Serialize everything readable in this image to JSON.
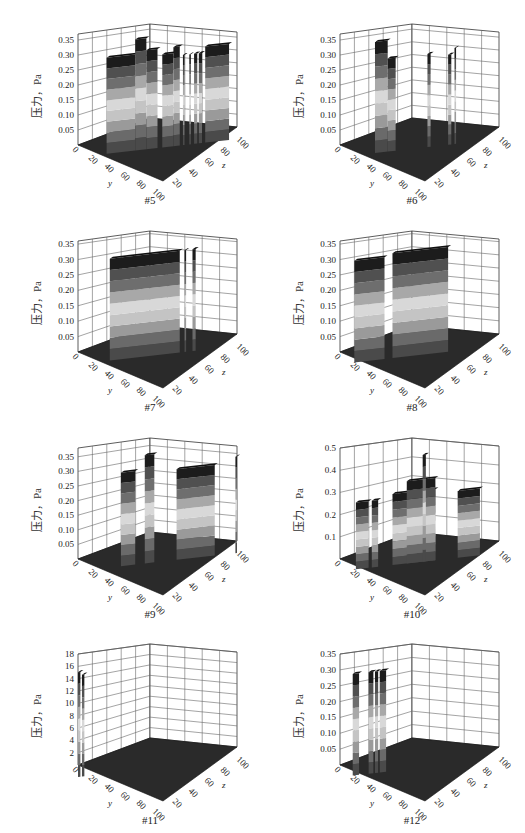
{
  "figure": {
    "panel_labels": [
      "#5",
      "#6",
      "#7",
      "#8",
      "#9",
      "#10",
      "#11",
      "#12"
    ]
  },
  "chart_data": [
    {
      "id": "#5",
      "type": "3d-surface-bars",
      "title": "#5",
      "zlabel": "压力，Pa",
      "xlabel": "y",
      "ylabel": "z",
      "zticks": [
        "0.05",
        "0.10",
        "0.15",
        "0.20",
        "0.25",
        "0.30",
        "0.35"
      ],
      "zlim": [
        0,
        0.37
      ],
      "xticks": [
        "0",
        "20",
        "40",
        "60",
        "80",
        "100"
      ],
      "yticks": [
        "20",
        "40",
        "60",
        "80",
        "100"
      ],
      "bars": [
        {
          "x0": 0.18,
          "x1": 0.36,
          "h": 0.32
        },
        {
          "x0": 0.36,
          "x1": 0.43,
          "h": 0.37
        },
        {
          "x0": 0.43,
          "x1": 0.5,
          "h": 0.33
        },
        {
          "x0": 0.53,
          "x1": 0.6,
          "h": 0.31
        },
        {
          "x0": 0.6,
          "x1": 0.64,
          "h": 0.33
        },
        {
          "x0": 0.66,
          "x1": 0.67,
          "h": 0.3
        },
        {
          "x0": 0.7,
          "x1": 0.71,
          "h": 0.3
        },
        {
          "x0": 0.73,
          "x1": 0.75,
          "h": 0.3
        },
        {
          "x0": 0.76,
          "x1": 0.78,
          "h": 0.3
        },
        {
          "x0": 0.8,
          "x1": 0.95,
          "h": 0.32
        }
      ]
    },
    {
      "id": "#6",
      "type": "3d-surface-bars",
      "title": "#6",
      "zlabel": "压力，Pa",
      "xlabel": "y",
      "ylabel": "z",
      "zticks": [
        "0.05",
        "0.10",
        "0.15",
        "0.20",
        "0.25",
        "0.30",
        "0.35"
      ],
      "zlim": [
        0,
        0.37
      ],
      "xticks": [
        "0",
        "20",
        "40",
        "60",
        "80",
        "100"
      ],
      "yticks": [
        "20",
        "40",
        "60",
        "80",
        "100"
      ],
      "bars": [
        {
          "x0": 0.22,
          "x1": 0.3,
          "h": 0.37
        },
        {
          "x0": 0.3,
          "x1": 0.35,
          "h": 0.31
        },
        {
          "x0": 0.55,
          "x1": 0.57,
          "h": 0.31
        },
        {
          "x0": 0.68,
          "x1": 0.7,
          "h": 0.3
        },
        {
          "x0": 0.72,
          "x1": 0.73,
          "h": 0.32
        }
      ]
    },
    {
      "id": "#7",
      "type": "3d-surface-bars",
      "title": "#7",
      "zlabel": "压力，Pa",
      "xlabel": "y",
      "ylabel": "z",
      "zticks": [
        "0.05",
        "0.10",
        "0.15",
        "0.20",
        "0.25",
        "0.30",
        "0.35"
      ],
      "zlim": [
        0,
        0.36
      ],
      "xticks": [
        "0",
        "20",
        "40",
        "60",
        "80",
        "100"
      ],
      "yticks": [
        "20",
        "40",
        "60",
        "80",
        "100"
      ],
      "bars": [
        {
          "x0": 0.2,
          "x1": 0.64,
          "h": 0.33
        },
        {
          "x0": 0.67,
          "x1": 0.68,
          "h": 0.33
        },
        {
          "x0": 0.72,
          "x1": 0.74,
          "h": 0.33
        }
      ]
    },
    {
      "id": "#8",
      "type": "3d-surface-bars",
      "title": "#8",
      "zlabel": "压力，Pa",
      "xlabel": "y",
      "ylabel": "z",
      "zticks": [
        "0.05",
        "0.10",
        "0.15",
        "0.20",
        "0.25",
        "0.30",
        "0.35"
      ],
      "zlim": [
        0,
        0.36
      ],
      "xticks": [
        "0",
        "20",
        "40",
        "60",
        "80",
        "100"
      ],
      "yticks": [
        "20",
        "40",
        "60",
        "80",
        "100"
      ],
      "bars": [
        {
          "x0": 0.09,
          "x1": 0.28,
          "h": 0.33
        },
        {
          "x0": 0.33,
          "x1": 0.68,
          "h": 0.34
        }
      ]
    },
    {
      "id": "#9",
      "type": "3d-surface-bars",
      "title": "#9",
      "zlabel": "压力，Pa",
      "xlabel": "y",
      "ylabel": "z",
      "zticks": [
        "0.05",
        "0.10",
        "0.15",
        "0.20",
        "0.25",
        "0.30",
        "0.35"
      ],
      "zlim": [
        0,
        0.38
      ],
      "xticks": [
        "0",
        "20",
        "40",
        "60",
        "80",
        "100"
      ],
      "yticks": [
        "20",
        "40",
        "60",
        "80",
        "100"
      ],
      "bars": [
        {
          "x0": 0.27,
          "x1": 0.36,
          "h": 0.32
        },
        {
          "x0": 0.42,
          "x1": 0.48,
          "h": 0.37
        },
        {
          "x0": 0.62,
          "x1": 0.86,
          "h": 0.31
        },
        {
          "x0": 0.99,
          "x1": 1.0,
          "h": 0.33
        }
      ]
    },
    {
      "id": "#10",
      "type": "3d-surface-bars",
      "title": "#10",
      "zlabel": "压力，Pa",
      "xlabel": "y",
      "ylabel": "z",
      "zticks": [
        "0.1",
        "0.2",
        "0.3",
        "0.4",
        "0.5"
      ],
      "zlim": [
        0,
        0.5
      ],
      "xticks": [
        "0",
        "20",
        "40",
        "60",
        "80",
        "100"
      ],
      "yticks": [
        "20",
        "40",
        "60",
        "80",
        "100"
      ],
      "bars": [
        {
          "x0": 0.1,
          "x1": 0.18,
          "h": 0.3
        },
        {
          "x0": 0.2,
          "x1": 0.24,
          "h": 0.3
        },
        {
          "x0": 0.33,
          "x1": 0.6,
          "h": 0.32
        },
        {
          "x0": 0.42,
          "x1": 0.6,
          "h": 0.37
        },
        {
          "x0": 0.52,
          "x1": 0.54,
          "h": 0.48
        },
        {
          "x0": 0.74,
          "x1": 0.88,
          "h": 0.3
        }
      ]
    },
    {
      "id": "#11",
      "type": "3d-surface-bars",
      "title": "#11",
      "zlabel": "压力，Pa",
      "xlabel": "y",
      "ylabel": "z",
      "zticks": [
        "2",
        "4",
        "6",
        "8",
        "10",
        "12",
        "14",
        "16",
        "18"
      ],
      "zlim": [
        0,
        18
      ],
      "xticks": [
        "0",
        "20",
        "40",
        "60",
        "80",
        "100"
      ],
      "yticks": [
        "20",
        "40",
        "60",
        "80",
        "100"
      ],
      "bars": [
        {
          "x0": 0.0,
          "x1": 0.015,
          "h": 17
        },
        {
          "x0": 0.025,
          "x1": 0.04,
          "h": 16.5
        }
      ]
    },
    {
      "id": "#12",
      "type": "3d-surface-bars",
      "title": "#12",
      "zlabel": "压力，Pa",
      "xlabel": "y",
      "ylabel": "z",
      "zticks": [
        "0.05",
        "0.10",
        "0.15",
        "0.20",
        "0.25",
        "0.30",
        "0.35"
      ],
      "zlim": [
        0,
        0.35
      ],
      "xticks": [
        "0",
        "20",
        "40",
        "60",
        "80",
        "100"
      ],
      "yticks": [
        "20",
        "40",
        "60",
        "80",
        "100"
      ],
      "bars": [
        {
          "x0": 0.08,
          "x1": 0.12,
          "h": 0.32
        },
        {
          "x0": 0.18,
          "x1": 0.21,
          "h": 0.32
        },
        {
          "x0": 0.22,
          "x1": 0.24,
          "h": 0.32
        },
        {
          "x0": 0.25,
          "x1": 0.29,
          "h": 0.32
        }
      ]
    }
  ],
  "colors": {
    "floor": "#2a2a2a",
    "grid": "#555555",
    "bands": [
      "#4a4a4a",
      "#6a6a6a",
      "#9a9a9a",
      "#c4c4c4",
      "#d8d8d8",
      "#a8a8a8",
      "#6e6e6e",
      "#505050",
      "#1c1c1c"
    ]
  }
}
